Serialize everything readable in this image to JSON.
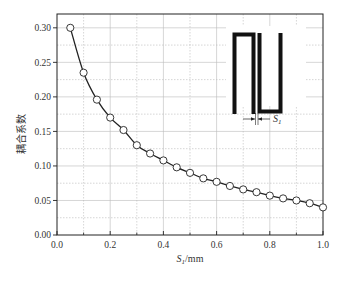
{
  "chart_data": {
    "type": "line",
    "title": "",
    "xlabel": "S1/mm",
    "xlabel_main": "S",
    "xlabel_sub": "1",
    "xlabel_unit": "/mm",
    "ylabel": "耦合系数",
    "xlim": [
      0.0,
      1.0
    ],
    "ylim": [
      0.0,
      0.32
    ],
    "xticks": [
      "0.0",
      "0.2",
      "0.4",
      "0.6",
      "0.8",
      "1.0"
    ],
    "yticks": [
      "0.00",
      "0.05",
      "0.10",
      "0.15",
      "0.20",
      "0.25",
      "0.30"
    ],
    "grid": true,
    "marker": "open-circle",
    "x": [
      0.05,
      0.1,
      0.15,
      0.2,
      0.25,
      0.3,
      0.35,
      0.4,
      0.45,
      0.5,
      0.55,
      0.6,
      0.65,
      0.7,
      0.75,
      0.8,
      0.85,
      0.9,
      0.95,
      1.0
    ],
    "series": [
      {
        "name": "耦合系数",
        "values": [
          0.3,
          0.235,
          0.196,
          0.17,
          0.152,
          0.13,
          0.118,
          0.108,
          0.098,
          0.09,
          0.082,
          0.077,
          0.071,
          0.066,
          0.062,
          0.057,
          0.053,
          0.05,
          0.046,
          0.04
        ]
      }
    ],
    "annotations": [
      {
        "type": "inset-diagram",
        "description": "hairpin resonator pair with gap",
        "label": "S1",
        "label_main": "S",
        "label_sub": "1"
      }
    ]
  }
}
